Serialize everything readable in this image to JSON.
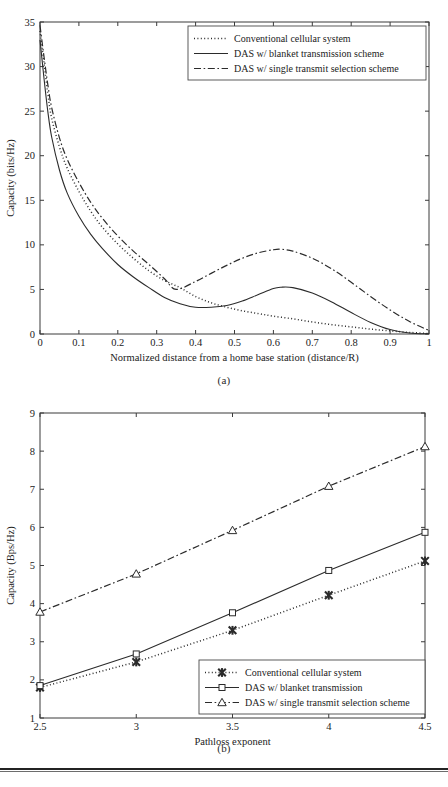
{
  "figures": [
    {
      "caption": "(a)",
      "chart_data": {
        "type": "line",
        "title": "",
        "xlabel": "Normalized distance from a home base station (distance/R)",
        "ylabel": "Capacity (bits/Hz)",
        "xlim": [
          0,
          1
        ],
        "ylim": [
          0,
          35
        ],
        "xticks": [
          "0",
          "0.1",
          "0.2",
          "0.3",
          "0.4",
          "0.5",
          "0.6",
          "0.7",
          "0.8",
          "0.9",
          "1"
        ],
        "yticks": [
          "0",
          "5",
          "10",
          "15",
          "20",
          "25",
          "30",
          "35"
        ],
        "grid": false,
        "legend_position": "top-right",
        "series": [
          {
            "name": "Conventional cellular system",
            "style": "dotted",
            "marker": "none",
            "x": [
              0.0,
              0.01,
              0.02,
              0.03,
              0.05,
              0.07,
              0.1,
              0.13,
              0.16,
              0.2,
              0.24,
              0.28,
              0.32,
              0.36,
              0.4,
              0.44,
              0.48,
              0.52,
              0.56,
              0.6,
              0.65,
              0.7,
              0.75,
              0.8,
              0.85,
              0.9,
              0.95,
              1.0
            ],
            "y": [
              34.0,
              30.5,
              27.0,
              24.2,
              21.0,
              18.6,
              16.0,
              13.8,
              12.0,
              10.1,
              8.5,
              7.1,
              6.0,
              5.2,
              4.2,
              3.5,
              3.0,
              2.6,
              2.3,
              2.0,
              1.7,
              1.35,
              1.05,
              0.8,
              0.55,
              0.35,
              0.18,
              0.05
            ]
          },
          {
            "name": "DAS w/ blanket transmission scheme",
            "style": "solid",
            "marker": "none",
            "x": [
              0.0,
              0.01,
              0.02,
              0.03,
              0.05,
              0.07,
              0.1,
              0.13,
              0.16,
              0.2,
              0.24,
              0.28,
              0.32,
              0.36,
              0.4,
              0.44,
              0.48,
              0.52,
              0.56,
              0.6,
              0.62,
              0.65,
              0.7,
              0.75,
              0.8,
              0.85,
              0.9,
              0.95,
              1.0
            ],
            "y": [
              33.0,
              28.8,
              25.0,
              22.1,
              18.4,
              15.8,
              13.2,
              11.2,
              9.6,
              7.8,
              6.4,
              5.2,
              4.1,
              3.4,
              3.0,
              3.0,
              3.2,
              3.7,
              4.4,
              5.1,
              5.25,
              5.2,
              4.6,
              3.6,
              2.4,
              1.3,
              0.5,
              0.12,
              0.02
            ]
          },
          {
            "name": "DAS w/ single transmit selection scheme",
            "style": "dashdot",
            "marker": "none",
            "x": [
              0.0,
              0.01,
              0.02,
              0.03,
              0.05,
              0.07,
              0.1,
              0.13,
              0.16,
              0.2,
              0.24,
              0.28,
              0.32,
              0.35,
              0.4,
              0.44,
              0.48,
              0.52,
              0.56,
              0.6,
              0.62,
              0.65,
              0.7,
              0.75,
              0.8,
              0.85,
              0.9,
              0.95,
              1.0
            ],
            "y": [
              34.6,
              31.2,
              28.0,
              25.4,
              22.0,
              19.6,
              17.0,
              14.8,
              13.0,
              11.0,
              9.3,
              7.8,
              6.2,
              5.0,
              5.9,
              6.8,
              7.7,
              8.5,
              9.1,
              9.45,
              9.5,
              9.3,
              8.5,
              7.3,
              5.8,
              4.2,
              2.7,
              1.4,
              0.4
            ]
          }
        ]
      },
      "legend": [
        {
          "label": "Conventional cellular system",
          "style": "dotted"
        },
        {
          "label": "DAS w/ blanket transmission scheme",
          "style": "solid"
        },
        {
          "label": "DAS w/ single transmit selection scheme",
          "style": "dashdot"
        }
      ]
    },
    {
      "caption": "(b)",
      "chart_data": {
        "type": "line",
        "title": "",
        "xlabel": "Pathloss exponent",
        "ylabel": "Capacity (Bps/Hz)",
        "xlim": [
          2.5,
          4.5
        ],
        "ylim": [
          1,
          9
        ],
        "xticks": [
          "2.5",
          "3",
          "3.5",
          "4",
          "4.5"
        ],
        "yticks": [
          "1",
          "2",
          "3",
          "4",
          "5",
          "6",
          "7",
          "8",
          "9"
        ],
        "grid": false,
        "legend_position": "bottom-right",
        "categories": [
          2.5,
          3,
          3.5,
          4,
          4.5
        ],
        "series": [
          {
            "name": "Conventional cellular system",
            "style": "dotted",
            "marker": "x-bold",
            "values": [
              1.8,
              2.47,
              3.3,
              4.22,
              5.12
            ]
          },
          {
            "name": "DAS w/ blanket transmission",
            "style": "solid",
            "marker": "square",
            "values": [
              1.85,
              2.68,
              3.76,
              4.87,
              5.87
            ]
          },
          {
            "name": "DAS w/ single transmit selection scheme",
            "style": "dashdot",
            "marker": "triangle",
            "values": [
              3.78,
              4.78,
              5.92,
              7.08,
              8.12
            ]
          }
        ]
      },
      "legend": [
        {
          "label": "Conventional cellular system",
          "style": "dotted",
          "marker": "x-bold"
        },
        {
          "label": "DAS w/ blanket transmission",
          "style": "solid",
          "marker": "square"
        },
        {
          "label": "DAS w/ single transmit selection scheme",
          "style": "dashdot",
          "marker": "triangle"
        }
      ]
    }
  ],
  "colors": {
    "line": "#2b2b2b",
    "axis": "#3a3a3a",
    "text": "#222222",
    "rule": "#232323"
  }
}
